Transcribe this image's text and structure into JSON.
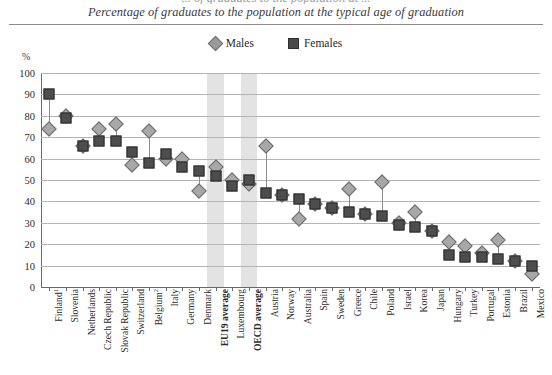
{
  "top_clipped_text": "... of graduates to the population at ...",
  "subtitle": "Percentage of graduates to the population at the typical age of graduation",
  "legend": {
    "males_label": "Males",
    "females_label": "Females",
    "male_color": "#a8a8a8",
    "female_color": "#4d4d4d"
  },
  "axis": {
    "y_unit_label": "%",
    "y_ticks": [
      "0",
      "10",
      "20",
      "30",
      "40",
      "50",
      "60",
      "70",
      "80",
      "90",
      "100"
    ],
    "y_min": 0,
    "y_max": 100,
    "y_step": 10
  },
  "highlight_color": "#dedede",
  "highlighted_categories": [
    "EU19 average",
    "OECD average"
  ],
  "chart_data": {
    "type": "scatter",
    "title": "",
    "subtitle": "Percentage of graduates to the population at the typical age of graduation",
    "xlabel": "",
    "ylabel": "%",
    "ylim": [
      0,
      100
    ],
    "grid": true,
    "legend_position": "top-center",
    "categories": [
      "Finland¹",
      "Slovenia",
      "Netherlands",
      "Czech Republic",
      "Slovak Republic",
      "Switzerland",
      "Belgium²",
      "Italy",
      "Germany",
      "Denmark",
      "EU19 average",
      "Luxembourg",
      "OECD average",
      "Austria",
      "Norway",
      "Australia",
      "Spain",
      "Sweden",
      "Greece",
      "Chile",
      "Poland",
      "Israel",
      "Korea",
      "Japan",
      "Hungary",
      "Turkey",
      "Portugal",
      "Estonia",
      "Brazil",
      "Mexico"
    ],
    "series": [
      {
        "name": "Males",
        "marker": "diamond",
        "color": "#a8a8a8",
        "values": [
          74,
          80,
          66,
          74,
          76,
          57,
          73,
          60,
          60,
          45,
          56,
          50,
          48,
          66,
          43,
          32,
          39,
          37,
          46,
          34,
          49,
          30,
          35,
          26,
          21,
          19,
          16,
          22,
          12,
          6
        ]
      },
      {
        "name": "Females",
        "marker": "square",
        "color": "#4d4d4d",
        "values": [
          90,
          79,
          66,
          68,
          68,
          63,
          58,
          62,
          56,
          54,
          52,
          47,
          50,
          44,
          43,
          41,
          39,
          37,
          35,
          34,
          33,
          29,
          28,
          26,
          15,
          14,
          14,
          13,
          12,
          10
        ]
      }
    ]
  }
}
